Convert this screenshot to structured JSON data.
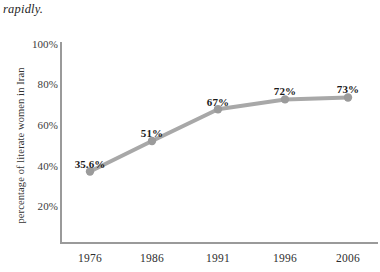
{
  "page": {
    "body_text": "rapidly."
  },
  "chart_data": {
    "type": "line",
    "title": "",
    "xlabel": "",
    "ylabel": "percentage of literate women in Iran",
    "categories": [
      "1976",
      "1986",
      "1991",
      "1996",
      "2006"
    ],
    "values": [
      35.6,
      51,
      67,
      72,
      73
    ],
    "point_labels": [
      "35.6%",
      "51%",
      "67%",
      "72%",
      "73%"
    ],
    "ytick_labels": [
      "100%",
      "80%",
      "60%",
      "40%",
      "20%"
    ],
    "ytick_values": [
      100,
      80,
      60,
      40,
      20
    ],
    "ylim": [
      0,
      100
    ],
    "grid": false,
    "legend": "none",
    "series_color": "#a8a8a8",
    "marker_color": "#9b9b9b",
    "axis_color": "#9a9a9a",
    "text_color": "#262626"
  }
}
